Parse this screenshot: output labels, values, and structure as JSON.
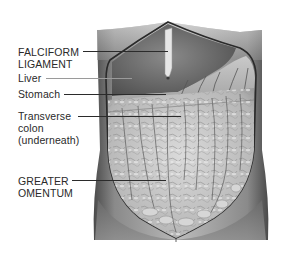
{
  "figure": {
    "colors": {
      "background": "#ffffff",
      "body_shadow": "#5a5a5a",
      "body_light": "#cfcfcf",
      "liver": "#6e6e6e",
      "stomach": "#bdbdbd",
      "omentum": "#c9c9c9",
      "outline": "#2a2a2a",
      "label_text": "#2a2a2a",
      "leader_line": "#2b2b2b"
    },
    "labels": [
      {
        "id": "falciform",
        "lines": [
          "FALCIFORM",
          "LIGAMENT"
        ]
      },
      {
        "id": "liver",
        "lines": [
          "Liver"
        ]
      },
      {
        "id": "stomach",
        "lines": [
          "Stomach"
        ]
      },
      {
        "id": "transverse-colon",
        "lines": [
          "Transverse",
          "colon",
          "(underneath)"
        ]
      },
      {
        "id": "greater-omentum",
        "lines": [
          "GREATER",
          "OMENTUM"
        ]
      }
    ]
  }
}
